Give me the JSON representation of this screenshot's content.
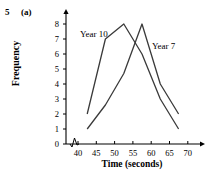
{
  "question": {
    "number": "5",
    "part": "(a)"
  },
  "chart_data": {
    "type": "line",
    "title": "",
    "xlabel": "Time (seconds)",
    "ylabel": "Frequency",
    "xlim": [
      40,
      70
    ],
    "ylim": [
      0,
      8
    ],
    "xticks": [
      40,
      45,
      50,
      55,
      60,
      65,
      70
    ],
    "yticks": [
      0,
      1,
      2,
      3,
      4,
      5,
      6,
      7,
      8
    ],
    "grid": false,
    "axis_break": true,
    "legend": "inline-labels",
    "series": [
      {
        "name": "Year 10",
        "label_position": "upper-left",
        "x": [
          42.5,
          47.5,
          52.5,
          57.5,
          62.5,
          67.5
        ],
        "values": [
          2,
          7,
          8,
          6,
          3,
          1
        ]
      },
      {
        "name": "Year 7",
        "label_position": "upper-right",
        "x": [
          42.5,
          47.5,
          52.5,
          57.5,
          62.5,
          67.5
        ],
        "values": [
          1,
          2.6,
          4.7,
          8,
          4,
          2
        ]
      }
    ],
    "colors": {
      "line": "#3a3a3a",
      "axis": "#000000",
      "background": "#ffffff"
    }
  }
}
